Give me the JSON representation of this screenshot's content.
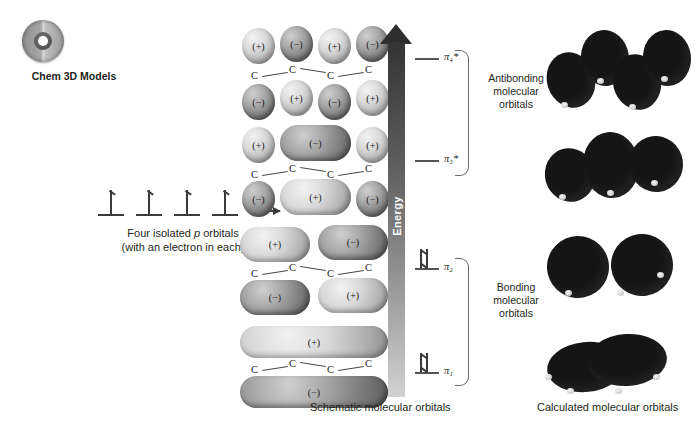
{
  "logo": {
    "icon": "cd-disc-icon",
    "caption": "Chem 3D Models"
  },
  "left_panel": {
    "caption_line1": "Four isolated ",
    "caption_italic": "p",
    "caption_line1b": " orbitals",
    "caption_line2": "(with an electron in each)",
    "orbital_count": 4,
    "arrow": "right-arrow"
  },
  "energy_axis": {
    "label": "Energy",
    "direction": "up"
  },
  "levels": [
    {
      "id": "pi4star",
      "label": "π₄*",
      "electrons": 0,
      "type": "antibonding"
    },
    {
      "id": "pi3star",
      "label": "π₃*",
      "electrons": 0,
      "type": "antibonding"
    },
    {
      "id": "pi2",
      "label": "π₂",
      "electrons": 2,
      "type": "bonding"
    },
    {
      "id": "pi1",
      "label": "π₁",
      "electrons": 2,
      "type": "bonding"
    }
  ],
  "brackets": [
    {
      "id": "antibonding",
      "lines": [
        "Antibonding",
        "molecular",
        "orbitals"
      ]
    },
    {
      "id": "bonding",
      "lines": [
        "Bonding",
        "molecular",
        "orbitals"
      ]
    }
  ],
  "schematic_orbitals": [
    {
      "id": "pi4star",
      "nodes": 3,
      "top_signs": [
        "(+)",
        "(−)",
        "(+)",
        "(−)"
      ],
      "bottom_signs": [
        "(−)",
        "(+)",
        "(−)",
        "(+)"
      ],
      "chain": [
        "C",
        "C",
        "C",
        "C"
      ]
    },
    {
      "id": "pi3star",
      "nodes": 2,
      "top_signs": [
        "(+)",
        "(−)",
        "(+)"
      ],
      "bottom_signs": [
        "(−)",
        "(+)",
        "(−)"
      ],
      "chain": [
        "C",
        "C",
        "C",
        "C"
      ]
    },
    {
      "id": "pi2",
      "nodes": 1,
      "top_signs": [
        "(+)",
        "(−)"
      ],
      "bottom_signs": [
        "(−)",
        "(+)"
      ],
      "chain": [
        "C",
        "C",
        "C",
        "C"
      ]
    },
    {
      "id": "pi1",
      "nodes": 0,
      "top_signs": [
        "(+)"
      ],
      "bottom_signs": [
        "(−)"
      ],
      "chain": [
        "C",
        "C",
        "C",
        "C"
      ]
    }
  ],
  "calculated_orbitals": [
    {
      "id": "pi4star",
      "blob_count": 4
    },
    {
      "id": "pi3star",
      "blob_count": 3
    },
    {
      "id": "pi2",
      "blob_count": 2
    },
    {
      "id": "pi1",
      "blob_count": 1
    }
  ],
  "captions": {
    "schematic": "Schematic molecular orbitals",
    "calculated": "Calculated molecular orbitals"
  },
  "colors": {
    "background": "#ffffff",
    "text": "#231f20",
    "lobe_plus": "#d9d9d9",
    "lobe_minus": "#7d7d7d",
    "blob": "#151515",
    "energy_dark": "#343434",
    "energy_light": "#d2d2d2"
  }
}
